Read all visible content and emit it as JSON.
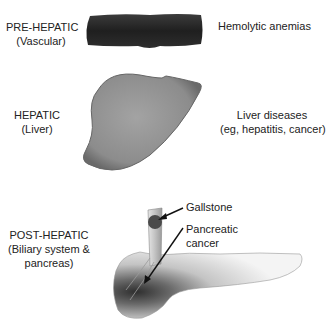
{
  "sections": [
    {
      "id": "pre-hepatic",
      "title": "PRE-HEPATIC",
      "subtitle": "(Vascular)",
      "cause": "Hemolytic anemias"
    },
    {
      "id": "hepatic",
      "title": "HEPATIC",
      "subtitle": "(Liver)",
      "cause_line1": "Liver diseases",
      "cause_line2": "(eg, hepatitis, cancer)"
    },
    {
      "id": "post-hepatic",
      "title": "POST-HEPATIC",
      "subtitle_line1": "(Biliary system &",
      "subtitle_line2": "pancreas)",
      "annotations": {
        "gallstone": "Gallstone",
        "pancreatic_cancer_line1": "Pancreatic",
        "pancreatic_cancer_line2": "cancer"
      }
    }
  ],
  "colors": {
    "vessel": "#2b2b2b",
    "liver": "#8e8e8e",
    "pancreas_dark": "#3a3a3a",
    "pancreas_light": "#f2f2f2",
    "duct": "#cfcfcf",
    "gallstone": "#4a4a4a",
    "text": "#222222"
  }
}
